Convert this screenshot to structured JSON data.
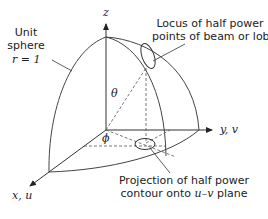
{
  "labels": {
    "unit_sphere": [
      "Unit",
      "sphere"
    ],
    "radius": "r = 1",
    "locus": [
      "Locus of half power",
      "points of beam or lobe"
    ],
    "projection": [
      "Projection of half power",
      "contour onto "
    ],
    "projection_uv": "u–v",
    "projection_tail": " plane",
    "theta": "θ",
    "phi": "ϕ",
    "z_axis": "z",
    "y_axis": "y, v",
    "x_axis": "x, u"
  },
  "colors": {
    "line": "#333333",
    "dash": "#555555",
    "text": "#222222"
  }
}
